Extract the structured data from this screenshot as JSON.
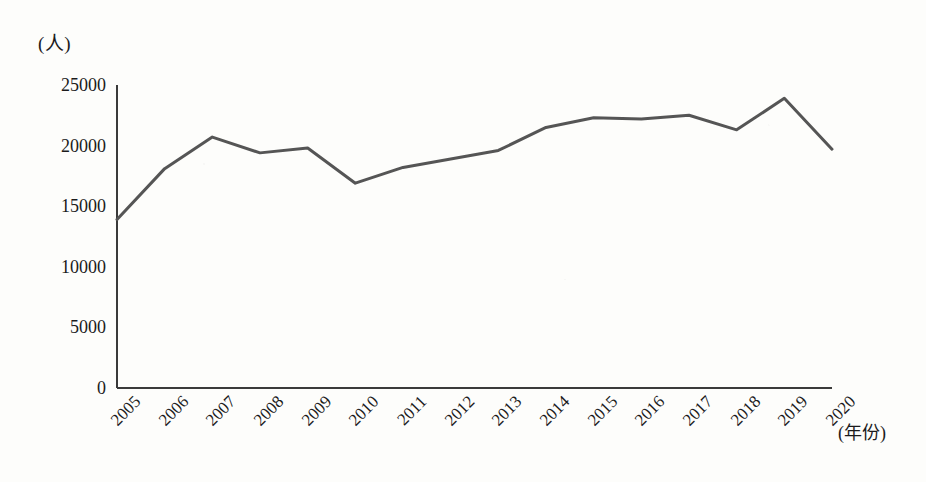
{
  "chart_data": {
    "type": "line",
    "title": "",
    "xlabel": "(年份)",
    "ylabel": "(人)",
    "categories": [
      "2005",
      "2006",
      "2007",
      "2008",
      "2009",
      "2010",
      "2011",
      "2012",
      "2013",
      "2014",
      "2015",
      "2016",
      "2017",
      "2018",
      "2019",
      "2020"
    ],
    "values": [
      13900,
      18100,
      20700,
      19400,
      19800,
      16900,
      18200,
      18900,
      19600,
      21500,
      22300,
      22200,
      22500,
      21300,
      23900,
      19700
    ],
    "series": [
      {
        "name": "人数",
        "values": [
          13900,
          18100,
          20700,
          19400,
          19800,
          16900,
          18200,
          18900,
          19600,
          21500,
          22300,
          22200,
          22500,
          21300,
          23900,
          19700
        ]
      }
    ],
    "ylim": [
      0,
      25000
    ],
    "y_ticks": [
      0,
      5000,
      10000,
      15000,
      20000,
      25000
    ],
    "y_tick_labels": [
      "0",
      "5000",
      "10000",
      "15000",
      "20000",
      "25000"
    ],
    "grid": false,
    "legend": "none",
    "line_color": "#555555",
    "axis_color": "#3a3a3a",
    "background_color": "#fdfdfb"
  }
}
